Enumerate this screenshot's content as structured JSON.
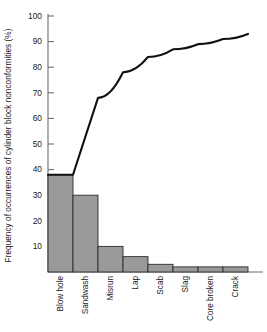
{
  "chart_data": {
    "type": "bar",
    "title": "",
    "subtitle": "",
    "xlabel": "",
    "ylabel": "Frequency of occurrences of cylinder block nonconformities (%)",
    "categories": [
      "Blow hole",
      "Sandwash",
      "Misrun",
      "Lap",
      "Scab",
      "Slag",
      "Core broken",
      "Crack"
    ],
    "values": [
      38,
      30,
      10,
      6,
      3,
      2,
      2,
      2
    ],
    "cumulative": [
      38,
      68,
      78,
      84,
      87,
      89,
      91,
      93
    ],
    "series": [
      {
        "name": "Frequency",
        "type": "bar",
        "values": [
          38,
          30,
          10,
          6,
          3,
          2,
          2,
          2
        ]
      },
      {
        "name": "Cumulative percentage",
        "type": "line",
        "values": [
          38,
          68,
          78,
          84,
          87,
          89,
          91,
          93
        ]
      }
    ],
    "ylim": [
      0,
      100
    ],
    "y_ticks": [
      10,
      20,
      30,
      40,
      50,
      60,
      70,
      80,
      90,
      100
    ],
    "y_tick_labels": [
      "10",
      "20",
      "30",
      "40",
      "50",
      "60",
      "70",
      "80",
      "90",
      "100"
    ],
    "grid": false,
    "legend": "none",
    "bar_color": "#9a9a9a",
    "bar_edge_color": "#2b2b2b",
    "line_color": "#111111",
    "axis_color": "#6e6e6e",
    "background": "#ffffff"
  }
}
